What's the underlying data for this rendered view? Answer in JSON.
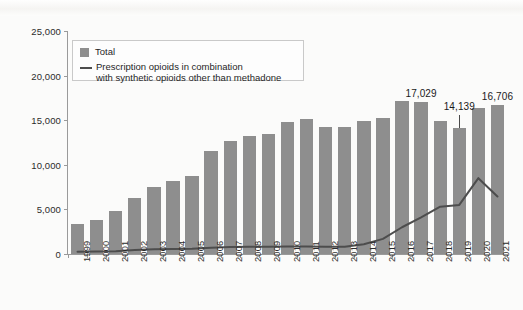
{
  "chart_data": {
    "type": "bar",
    "title": "",
    "subtitle": "",
    "xlabel": "",
    "ylabel": "",
    "ylim": [
      0,
      25000
    ],
    "grid": false,
    "legend_position": "top-left",
    "categories": [
      "1999",
      "2000",
      "2001",
      "2002",
      "2003",
      "2004",
      "2005",
      "2006",
      "2007",
      "2008",
      "2009",
      "2010",
      "2011",
      "2012",
      "2013",
      "2014",
      "2015",
      "2016",
      "2017",
      "2018",
      "2019",
      "2020",
      "2021"
    ],
    "y_ticks": [
      0,
      5000,
      10000,
      15000,
      20000,
      25000
    ],
    "y_tick_labels": [
      "0",
      "5,000",
      "10,000",
      "15,000",
      "20,000",
      "25,000"
    ],
    "series": [
      {
        "name": "Total",
        "type": "bar",
        "color": "#8e8e8e",
        "values": [
          3360,
          3780,
          4770,
          6240,
          7460,
          8230,
          8800,
          11600,
          12700,
          13200,
          13500,
          14800,
          15100,
          14200,
          14200,
          14900,
          15300,
          17100,
          17029,
          14900,
          14139,
          16400,
          16706
        ]
      },
      {
        "name": "Prescription opioids in combination with synthetic opioids other than methadone",
        "type": "line",
        "color": "#4d4d4d",
        "values": [
          250,
          280,
          320,
          450,
          520,
          560,
          600,
          700,
          780,
          800,
          800,
          850,
          850,
          800,
          800,
          1100,
          1700,
          3000,
          4100,
          5300,
          5500,
          8500,
          6450
        ]
      }
    ],
    "annotations": [
      {
        "category": "2017",
        "value": 17029,
        "label": "17,029",
        "leader": false
      },
      {
        "category": "2019",
        "value": 14139,
        "label": "14,139",
        "leader": true
      },
      {
        "category": "2021",
        "value": 16706,
        "label": "16,706",
        "leader": false
      }
    ]
  },
  "legend": {
    "items": [
      {
        "marker": "swatch",
        "label": "Total"
      },
      {
        "marker": "line",
        "label_line1": "Prescription opioids in combination",
        "label_line2": "with synthetic opioids other than methadone"
      }
    ]
  }
}
